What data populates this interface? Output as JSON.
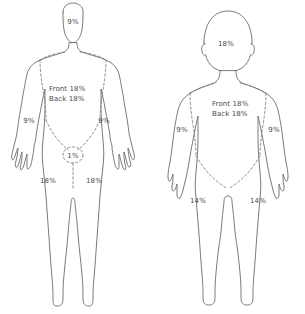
{
  "diagram": {
    "type": "body-surface-area-burn-chart",
    "figures": [
      {
        "id": "adult",
        "name": "adult-figure",
        "regions": [
          {
            "key": "head",
            "label": "9%"
          },
          {
            "key": "torso_front",
            "label": "Front 18%"
          },
          {
            "key": "torso_back",
            "label": "Back 18%"
          },
          {
            "key": "arm_right",
            "label": "9%"
          },
          {
            "key": "arm_left",
            "label": "9%"
          },
          {
            "key": "groin",
            "label": "1%"
          },
          {
            "key": "leg_right",
            "label": "18%"
          },
          {
            "key": "leg_left",
            "label": "18%"
          }
        ]
      },
      {
        "id": "child",
        "name": "child-figure",
        "regions": [
          {
            "key": "head",
            "label": "18%"
          },
          {
            "key": "torso_front",
            "label": "Front 18%"
          },
          {
            "key": "torso_back",
            "label": "Back 18%"
          },
          {
            "key": "arm_right",
            "label": "9%"
          },
          {
            "key": "arm_left",
            "label": "9%"
          },
          {
            "key": "leg_right",
            "label": "14%"
          },
          {
            "key": "leg_left",
            "label": "14%"
          }
        ]
      }
    ],
    "colors": {
      "outline": "#6b6b6b",
      "divider": "#7a7a7a",
      "text": "#4a4a4a",
      "background": "#ffffff"
    }
  }
}
